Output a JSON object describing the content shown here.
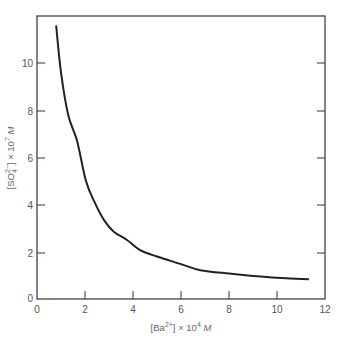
{
  "chart_data": {
    "type": "line",
    "title": "",
    "xlabel": "[Ba2+] × 10^4 M",
    "ylabel": "[SO4 2−] × 10^7 M",
    "xlim": [
      0,
      12
    ],
    "ylim": [
      0,
      12
    ],
    "x_ticks": [
      0,
      2,
      4,
      6,
      8,
      10,
      12
    ],
    "y_ticks": [
      0,
      2,
      4,
      6,
      8,
      10
    ],
    "grid": false,
    "legend": null,
    "series": [
      {
        "name": "solubility curve",
        "x": [
          0.8,
          1.0,
          1.3,
          1.67,
          2.04,
          2.4,
          2.8,
          3.2,
          3.75,
          4.3,
          5.0,
          6.0,
          6.8,
          8.0,
          9.0,
          10.0,
          11.3
        ],
        "y": [
          11.56,
          9.6,
          7.8,
          6.7,
          5.0,
          4.1,
          3.33,
          2.85,
          2.5,
          2.07,
          1.8,
          1.48,
          1.22,
          1.08,
          0.98,
          0.9,
          0.84
        ]
      }
    ]
  },
  "axes": {
    "x_label_main": "[Ba",
    "x_label_sup": "2+",
    "x_label_rest": "] × 10",
    "x_label_exp": "4",
    "x_label_unit": " M",
    "y_label_main": "[SO",
    "y_label_sub": "4",
    "y_label_sup": "2−",
    "y_label_rest": "] × 10",
    "y_label_exp": "7",
    "y_label_unit": " M",
    "x_tick_labels": [
      "0",
      "2",
      "4",
      "6",
      "8",
      "10",
      "12"
    ],
    "y_tick_labels": [
      "0",
      "2",
      "4",
      "6",
      "8",
      "10"
    ]
  }
}
